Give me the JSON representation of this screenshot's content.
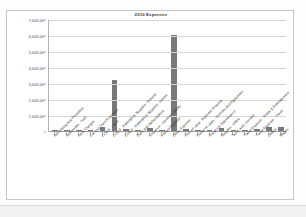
{
  "chart_data": {
    "type": "bar",
    "title": "2010 Expenses",
    "xlabel": "",
    "ylabel": "",
    "ylim": [
      0,
      7000
    ],
    "grid": true,
    "legend": false,
    "ytick_labels": [
      "7,000.00",
      "6,000.00",
      "5,000.00",
      "4,000.00",
      "3,000.00",
      "2,000.00",
      "1,000.00",
      "-"
    ],
    "ytick_values": [
      7000,
      6000,
      5000,
      4000,
      3000,
      2000,
      1000,
      0
    ],
    "categories": [
      "Advertising and Promotion",
      "Automobile - Fuel",
      "Bank Charges",
      "Car and Truck Expenses",
      "COGS - Labor",
      "COGS - Materials & Supplies - Exterior",
      "COGS - Materials & Supplies - Interior",
      "Dues and Subscriptions",
      "Insurance - General Liability",
      "Interest Expense",
      "Office Expense",
      "Rent of Land - Business Property",
      "Rental of Lawn - Vehicles and Equipment",
      "Repairs & Maintenance",
      "Supplies - Office",
      "Taxes and Licenses",
      "Travel Expense - Meals & Entertainment",
      "Travel Expense - Travel",
      "Utilities",
      "Wages"
    ],
    "values": [
      60,
      90,
      25,
      30,
      260,
      3200,
      110,
      40,
      180,
      35,
      6000,
      95,
      40,
      55,
      160,
      45,
      30,
      120,
      240,
      230
    ],
    "bar_color": "#787878"
  }
}
